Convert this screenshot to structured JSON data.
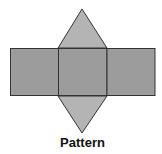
{
  "diagram": {
    "type": "net",
    "label": "Pattern",
    "colors": {
      "rectangle_fill": "#9c9c9c",
      "triangle_fill": "#b4b4b4",
      "stroke": "#333333",
      "background": "#ffffff"
    },
    "shapes": [
      {
        "id": "left-rect",
        "kind": "rect"
      },
      {
        "id": "center-square",
        "kind": "rect"
      },
      {
        "id": "right-rect",
        "kind": "rect"
      },
      {
        "id": "top-triangle",
        "kind": "triangle"
      },
      {
        "id": "bottom-triangle",
        "kind": "triangle"
      }
    ]
  }
}
